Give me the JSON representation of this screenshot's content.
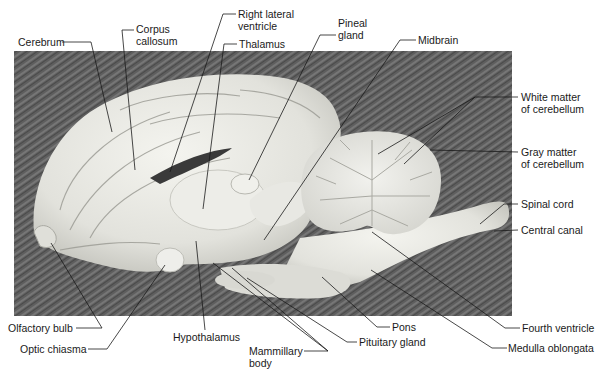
{
  "figure": {
    "type": "anatomical-photograph",
    "colors": {
      "background": "#ffffff",
      "photo_backdrop": "#5a5a5a",
      "tissue_light": "#ebebe6",
      "tissue_shadow": "#b9b9b3",
      "leader_line": "#1a1a1a",
      "label_text": "#1a1a1a"
    }
  },
  "labels": {
    "cerebrum": "Cerebrum",
    "corpus_callosum_1": "Corpus",
    "corpus_callosum_2": "callosum",
    "right_lateral_ventricle_1": "Right lateral",
    "right_lateral_ventricle_2": "ventricle",
    "thalamus": "Thalamus",
    "pineal_gland_1": "Pineal",
    "pineal_gland_2": "gland",
    "midbrain": "Midbrain",
    "white_matter_1": "White matter",
    "white_matter_2": "of cerebellum",
    "gray_matter_1": "Gray matter",
    "gray_matter_2": "of cerebellum",
    "spinal_cord": "Spinal cord",
    "central_canal": "Central canal",
    "olfactory_bulb": "Olfactory bulb",
    "optic_chiasma": "Optic chiasma",
    "hypothalamus": "Hypothalamus",
    "mammillary_body_1": "Mammillary",
    "mammillary_body_2": "body",
    "pons": "Pons",
    "pituitary_gland": "Pituitary gland",
    "fourth_ventricle": "Fourth ventricle",
    "medulla_oblongata": "Medulla oblongata"
  }
}
